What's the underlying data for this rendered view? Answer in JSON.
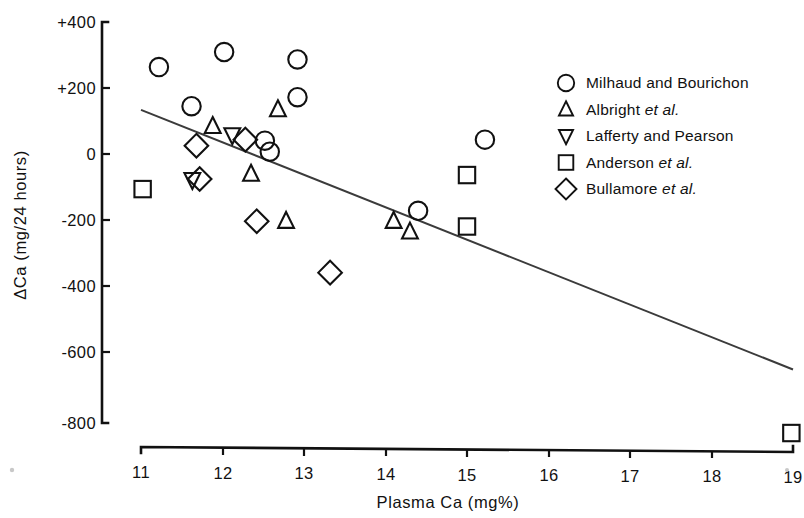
{
  "chart_data": {
    "type": "scatter",
    "title": "",
    "xlabel": "Plasma Ca (mg%)",
    "ylabel": "ΔCa (mg/24 hours)",
    "xlim": [
      11,
      19
    ],
    "ylim": [
      -800,
      400
    ],
    "xticks": [
      11,
      12,
      13,
      14,
      15,
      16,
      17,
      18,
      19
    ],
    "xticklabels": [
      "11",
      "12",
      "13",
      "14",
      "15",
      "16",
      "17",
      "18",
      "19"
    ],
    "yticks": [
      400,
      200,
      0,
      -200,
      -400,
      -600,
      -800
    ],
    "yticklabels": [
      "+400",
      "+200",
      "0",
      "-200",
      "-400",
      "-600",
      "-800"
    ],
    "grid": false,
    "legend_position": "upper right",
    "series": [
      {
        "name": "Milhaud and Bourichon",
        "marker": "circle",
        "points": [
          {
            "x": 11.22,
            "y": 265
          },
          {
            "x": 12.02,
            "y": 310
          },
          {
            "x": 11.62,
            "y": 148
          },
          {
            "x": 12.92,
            "y": 288
          },
          {
            "x": 12.92,
            "y": 175
          },
          {
            "x": 12.52,
            "y": 45
          },
          {
            "x": 12.58,
            "y": 12
          },
          {
            "x": 15.22,
            "y": 48
          },
          {
            "x": 14.4,
            "y": -165
          }
        ]
      },
      {
        "name": "Albright et al.",
        "marker": "triangle-up",
        "points": [
          {
            "x": 11.88,
            "y": 88
          },
          {
            "x": 12.68,
            "y": 138
          },
          {
            "x": 12.35,
            "y": -55
          },
          {
            "x": 12.78,
            "y": -196
          },
          {
            "x": 14.1,
            "y": -196
          },
          {
            "x": 14.3,
            "y": -228
          }
        ]
      },
      {
        "name": "Lafferty and Pearson",
        "marker": "triangle-down",
        "points": [
          {
            "x": 11.63,
            "y": -72
          },
          {
            "x": 12.12,
            "y": 62
          }
        ]
      },
      {
        "name": "Anderson et al.",
        "marker": "square",
        "points": [
          {
            "x": 11.02,
            "y": -100
          },
          {
            "x": 15.0,
            "y": -58
          },
          {
            "x": 15.0,
            "y": -212
          },
          {
            "x": 18.98,
            "y": -830
          }
        ]
      },
      {
        "name": "Bullamore et al.",
        "marker": "diamond",
        "points": [
          {
            "x": 11.68,
            "y": 30
          },
          {
            "x": 11.72,
            "y": -70
          },
          {
            "x": 12.28,
            "y": 48
          },
          {
            "x": 12.42,
            "y": -196
          },
          {
            "x": 13.32,
            "y": -350
          }
        ]
      }
    ],
    "trendline": {
      "name": "regression line",
      "x_start": 11.0,
      "y_start": 137,
      "x_end": 19.0,
      "y_end": -640
    }
  },
  "legend": {
    "entries": [
      {
        "marker": "circle",
        "label": "Milhaud and Bourichon",
        "italic_part": ""
      },
      {
        "marker": "triangle-up",
        "label": "Albright ",
        "italic_part": "et al."
      },
      {
        "marker": "triangle-down",
        "label": "Lafferty and Pearson",
        "italic_part": ""
      },
      {
        "marker": "square",
        "label": "Anderson ",
        "italic_part": "et al."
      },
      {
        "marker": "diamond",
        "label": "Bullamore ",
        "italic_part": "et al."
      }
    ]
  },
  "axes": {
    "x_title": "Plasma Ca (mg%)",
    "y_title": "ΔCa (mg/24 hours)",
    "x_tick_labels": [
      "11",
      "12",
      "13",
      "14",
      "15",
      "16",
      "17",
      "18",
      "19"
    ],
    "y_tick_labels": [
      "+400",
      "+200",
      "0",
      "-200",
      "-400",
      "-600",
      "-800"
    ]
  }
}
